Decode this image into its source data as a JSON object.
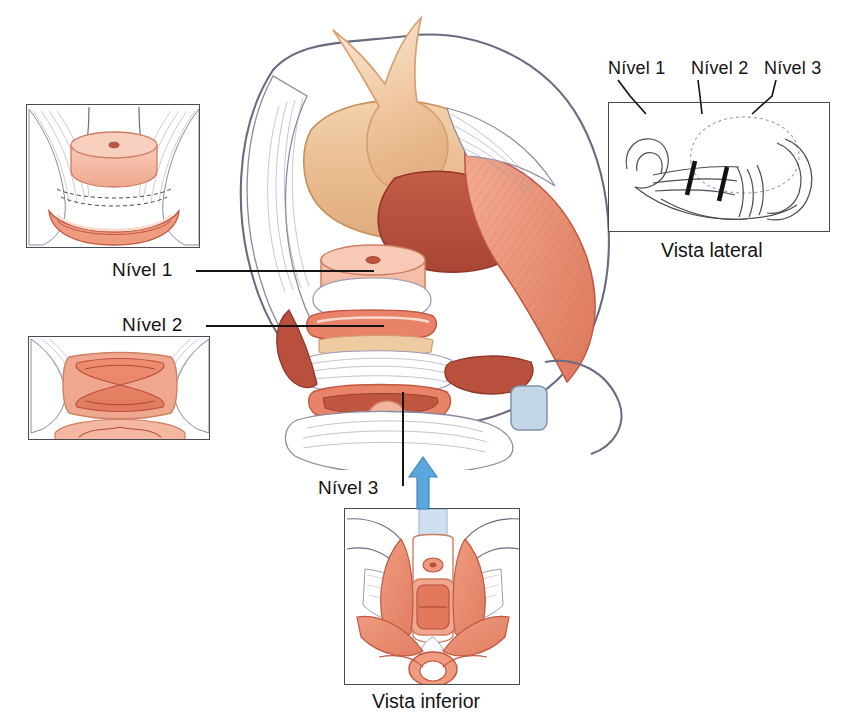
{
  "figure": {
    "language": "pt-BR",
    "background_color": "#ffffff"
  },
  "labels": {
    "level1": "Nível 1",
    "level2": "Nível 2",
    "level3": "Nível 3",
    "lateral_level1": "Nível 1",
    "lateral_level2": "Nível 2",
    "lateral_level3": "Nível 3"
  },
  "captions": {
    "lateral_view": "Vista lateral",
    "inferior_view": "Vista inferior"
  },
  "insets": {
    "level1_inset": {
      "name": "Nível 1 — corte transversal do colo uterino",
      "structures": [
        "cervix-disc",
        "paracolpos-fascia",
        "rectum"
      ]
    },
    "level2_inset": {
      "name": "Nível 2 — corte transversal da vagina",
      "structures": [
        "vagina-h-shape",
        "arcus-tendineus",
        "rectum"
      ]
    },
    "lateral_inset": {
      "name": "Vista lateral sagital",
      "markers": [
        "level-1-marker",
        "level-2-marker"
      ]
    },
    "inferior_inset": {
      "name": "Vista inferior do períneo",
      "structures": [
        "urethra",
        "vagina",
        "perineal-body",
        "anus",
        "levator-ani"
      ]
    }
  },
  "central": {
    "name": "Corte coronal/oblíquo da pelve feminina",
    "structures": [
      "bladder",
      "uterus",
      "cervix",
      "vagina",
      "levator-ani",
      "obturator-internus",
      "pubic-symphysis",
      "pelvic-brim",
      "rectum"
    ]
  },
  "arrow": {
    "name": "seta-de-referencia-nivel-3",
    "direction": "up",
    "color": "#59a7dd"
  },
  "colors": {
    "outline": "#6a6a82",
    "dark_outline": "#4a4a52",
    "bladder": "#e8b98b",
    "uterus": "#b8503d",
    "cervix": "#f0a98f",
    "cervix_light": "#f6c7b4",
    "muscle": "#e8836a",
    "muscle_light": "#f0a78f",
    "muscle_dark": "#c0563f",
    "fascia": "#ffffff",
    "fascia_line": "#8a8aa0",
    "arrow_blue": "#59a7dd",
    "symphysis": "#c3d6e8",
    "text": "#141414"
  }
}
